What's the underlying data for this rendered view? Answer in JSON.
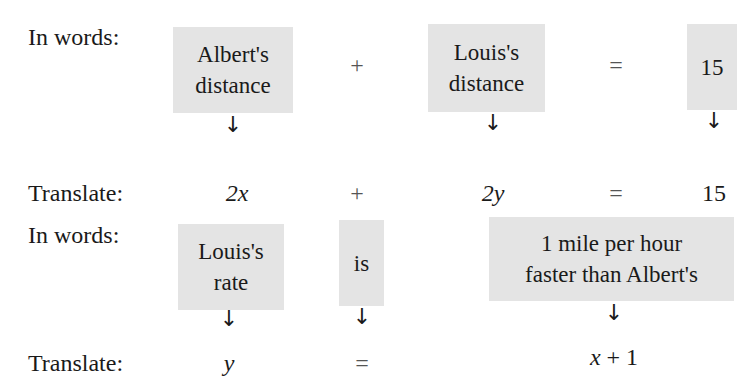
{
  "section1": {
    "words_label": "In words:",
    "boxes": [
      {
        "line1": "Albert's",
        "line2": "distance"
      },
      {
        "line1": "Louis's",
        "line2": "distance"
      },
      {
        "line1": "15"
      }
    ],
    "ops": [
      "+",
      "="
    ],
    "translate_label": "Translate:",
    "translation": [
      "2x",
      "+",
      "2y",
      "=",
      "15"
    ]
  },
  "section2": {
    "words_label": "In words:",
    "boxes": [
      {
        "line1": "Louis's",
        "line2": "rate"
      },
      {
        "line1": "is"
      },
      {
        "line1": "1 mile per hour",
        "line2": "faster than Albert's"
      }
    ],
    "translate_label": "Translate:",
    "translation": [
      "y",
      "=",
      "x + 1"
    ]
  },
  "arrow_glyph": "↓"
}
